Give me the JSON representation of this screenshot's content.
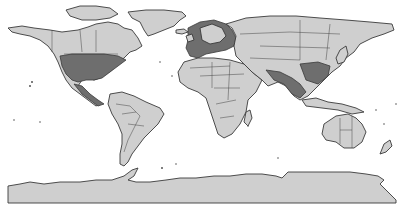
{
  "map": {
    "projection": "equirectangular",
    "colors": {
      "ocean": "#ffffff",
      "land": "#cfcfcf",
      "dense_region": "#6e6e6e",
      "outline": "#3a3a3a"
    },
    "regions": [
      {
        "name": "north-america"
      },
      {
        "name": "greenland"
      },
      {
        "name": "south-america"
      },
      {
        "name": "europe"
      },
      {
        "name": "africa"
      },
      {
        "name": "asia"
      },
      {
        "name": "australia"
      },
      {
        "name": "new-zealand"
      },
      {
        "name": "antarctica"
      },
      {
        "name": "maritime-southeast-asia"
      },
      {
        "name": "japan"
      },
      {
        "name": "madagascar"
      },
      {
        "name": "iceland"
      }
    ]
  }
}
